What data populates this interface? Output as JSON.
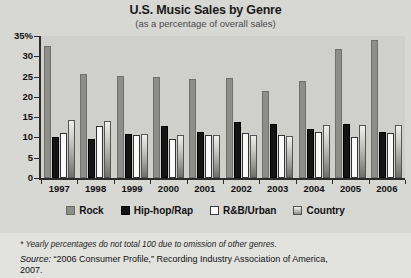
{
  "chart_data": {
    "type": "bar",
    "title": "U.S. Music Sales by Genre",
    "subtitle": "(as a percentage of overall sales)",
    "xlabel": "",
    "ylabel": "",
    "ylim": [
      0,
      35
    ],
    "yticks": [
      0,
      5,
      10,
      15,
      20,
      25,
      30,
      35
    ],
    "ytick_labels": [
      "0",
      "5",
      "10",
      "15",
      "20",
      "25",
      "30",
      "35%"
    ],
    "grid": false,
    "legend_position": "bottom",
    "categories": [
      "1997",
      "1998",
      "1999",
      "2000",
      "2001",
      "2002",
      "2003",
      "2004",
      "2005",
      "2006"
    ],
    "series": [
      {
        "name": "Rock",
        "color": "#8d8d8a",
        "values": [
          32.5,
          25.7,
          25.2,
          24.8,
          24.4,
          24.7,
          21.5,
          23.9,
          31.8,
          34.0
        ]
      },
      {
        "name": "Hip-hop/Rap",
        "color": "#141414",
        "values": [
          10.1,
          9.7,
          10.8,
          12.9,
          11.4,
          13.8,
          13.3,
          12.1,
          13.3,
          11.4
        ]
      },
      {
        "name": "R&B/Urban",
        "color": "#fafafa",
        "values": [
          11.2,
          12.8,
          10.5,
          9.7,
          10.6,
          11.2,
          10.6,
          11.3,
          10.2,
          11.0
        ]
      },
      {
        "name": "Country",
        "color": "#9a9a97",
        "values": [
          14.4,
          14.1,
          10.8,
          10.7,
          10.5,
          10.7,
          10.4,
          13.0,
          13.0,
          13.0
        ]
      }
    ]
  },
  "notes": {
    "footnote": "* Yearly percentages do not total 100 due to omission of other genres.",
    "source_label": "Source:",
    "source_text": " “2006 Consumer Profile,” Recording Industry Association of America,",
    "source_year": "2007."
  }
}
